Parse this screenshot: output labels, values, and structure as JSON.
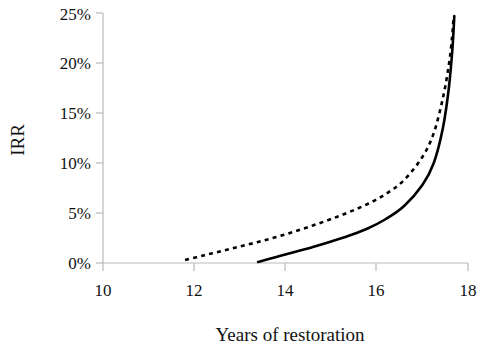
{
  "chart_data": {
    "type": "line",
    "title": "",
    "xlabel": "Years of restoration",
    "ylabel": "IRR",
    "xlim": [
      10,
      18
    ],
    "ylim": [
      0,
      25
    ],
    "grid": false,
    "legend": "none",
    "x_ticks": [
      "10",
      "12",
      "14",
      "16",
      "18"
    ],
    "x_tick_values": [
      10,
      12,
      14,
      16,
      18
    ],
    "y_ticks": [
      "0%",
      "5%",
      "10%",
      "15%",
      "20%",
      "25%"
    ],
    "y_tick_values": [
      0,
      5,
      10,
      15,
      20,
      25
    ],
    "series": [
      {
        "name": "dotted-curve",
        "style": "dotted",
        "color": "#000000",
        "x": [
          11.8,
          12.2,
          12.6,
          13.0,
          13.4,
          13.8,
          14.2,
          14.6,
          15.0,
          15.4,
          15.8,
          16.2,
          16.6,
          17.0,
          17.25,
          17.45,
          17.58,
          17.65,
          17.68
        ],
        "y": [
          0.3,
          0.75,
          1.2,
          1.65,
          2.1,
          2.6,
          3.15,
          3.75,
          4.4,
          5.1,
          5.9,
          6.9,
          8.3,
          10.6,
          13.0,
          16.5,
          19.8,
          22.5,
          24.3
        ]
      },
      {
        "name": "solid-curve",
        "style": "solid",
        "color": "#000000",
        "x": [
          13.4,
          13.8,
          14.2,
          14.6,
          15.0,
          15.4,
          15.8,
          16.2,
          16.6,
          17.0,
          17.25,
          17.45,
          17.58,
          17.66,
          17.7
        ],
        "y": [
          0.1,
          0.6,
          1.1,
          1.6,
          2.15,
          2.75,
          3.45,
          4.4,
          5.7,
          7.8,
          10.0,
          13.5,
          17.5,
          21.5,
          24.7
        ]
      }
    ]
  },
  "geometry": {
    "plot_left": 103,
    "plot_right": 468,
    "plot_top": 13,
    "plot_bottom": 263
  }
}
